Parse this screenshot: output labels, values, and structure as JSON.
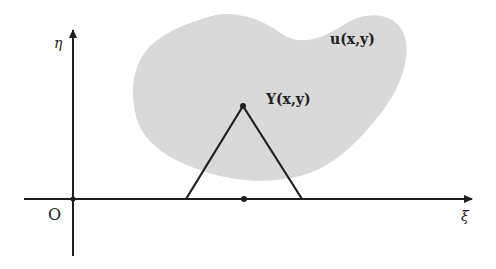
{
  "diagram": {
    "type": "coordinate-sketch",
    "colors": {
      "background": "#ffffff",
      "region_fill": "#d9d9d9",
      "stroke": "#1f1f1f"
    },
    "axes": {
      "horizontal_label": "ξ",
      "vertical_label": "η",
      "origin_label": "O"
    },
    "region": {
      "label": "u(x,y)"
    },
    "triangle": {
      "apex_label": "Υ(x,y)",
      "apex_point": [
        243,
        106
      ],
      "base_left": [
        186,
        199
      ],
      "base_right": [
        302,
        199
      ],
      "base_mid_point": [
        244,
        199
      ]
    }
  }
}
